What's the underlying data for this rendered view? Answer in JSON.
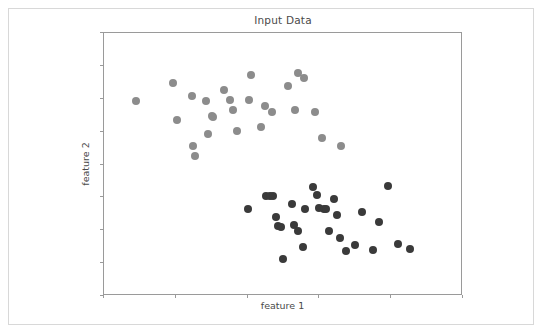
{
  "figure": {
    "title": "Input Data",
    "background_color": "#ffffff",
    "border_color": "#d8d8d8",
    "axes_color": "#9a9a9a"
  },
  "axes": {
    "xlabel": "feature 1",
    "ylabel": "feature 2",
    "tick_labels_visible": false,
    "x_tick_count": 6,
    "y_tick_count": 9
  },
  "chart_data": {
    "type": "scatter",
    "title": "Input Data",
    "xlabel": "feature 1",
    "ylabel": "feature 2",
    "grid": false,
    "legend": null,
    "xlim": [
      0,
      1
    ],
    "ylim": [
      0,
      1
    ],
    "xticks": [
      0.0,
      0.2,
      0.4,
      0.6,
      0.8,
      1.0
    ],
    "yticks": [
      0.0,
      0.125,
      0.25,
      0.375,
      0.5,
      0.625,
      0.75,
      0.875,
      1.0
    ],
    "xticklabels": [],
    "yticklabels": [],
    "marker": "circle",
    "marker_size_px": 8,
    "series": [
      {
        "name": "cluster 0",
        "color": "#8c8c8c",
        "points": [
          [
            0.09,
            0.74
          ],
          [
            0.192,
            0.81
          ],
          [
            0.203,
            0.668
          ],
          [
            0.245,
            0.762
          ],
          [
            0.248,
            0.57
          ],
          [
            0.253,
            0.533
          ],
          [
            0.284,
            0.74
          ],
          [
            0.29,
            0.615
          ],
          [
            0.302,
            0.684
          ],
          [
            0.304,
            0.68
          ],
          [
            0.333,
            0.783
          ],
          [
            0.35,
            0.745
          ],
          [
            0.358,
            0.707
          ],
          [
            0.37,
            0.627
          ],
          [
            0.405,
            0.745
          ],
          [
            0.41,
            0.84
          ],
          [
            0.437,
            0.641
          ],
          [
            0.449,
            0.722
          ],
          [
            0.468,
            0.699
          ],
          [
            0.512,
            0.8
          ],
          [
            0.533,
            0.706
          ],
          [
            0.54,
            0.849
          ],
          [
            0.556,
            0.828
          ],
          [
            0.588,
            0.7
          ],
          [
            0.606,
            0.601
          ],
          [
            0.66,
            0.569
          ]
        ]
      },
      {
        "name": "cluster 1",
        "color": "#3a3a3a",
        "points": [
          [
            0.402,
            0.332
          ],
          [
            0.452,
            0.381
          ],
          [
            0.462,
            0.379
          ],
          [
            0.47,
            0.38
          ],
          [
            0.478,
            0.3
          ],
          [
            0.486,
            0.268
          ],
          [
            0.494,
            0.264
          ],
          [
            0.499,
            0.14
          ],
          [
            0.524,
            0.348
          ],
          [
            0.53,
            0.269
          ],
          [
            0.54,
            0.248
          ],
          [
            0.554,
            0.188
          ],
          [
            0.56,
            0.329
          ],
          [
            0.582,
            0.413
          ],
          [
            0.592,
            0.384
          ],
          [
            0.6,
            0.333
          ],
          [
            0.612,
            0.33
          ],
          [
            0.619,
            0.331
          ],
          [
            0.627,
            0.249
          ],
          [
            0.64,
            0.37
          ],
          [
            0.648,
            0.308
          ],
          [
            0.656,
            0.22
          ],
          [
            0.674,
            0.173
          ],
          [
            0.7,
            0.194
          ],
          [
            0.719,
            0.32
          ],
          [
            0.748,
            0.176
          ],
          [
            0.766,
            0.282
          ],
          [
            0.79,
            0.417
          ],
          [
            0.818,
            0.198
          ],
          [
            0.853,
            0.178
          ]
        ]
      }
    ]
  }
}
